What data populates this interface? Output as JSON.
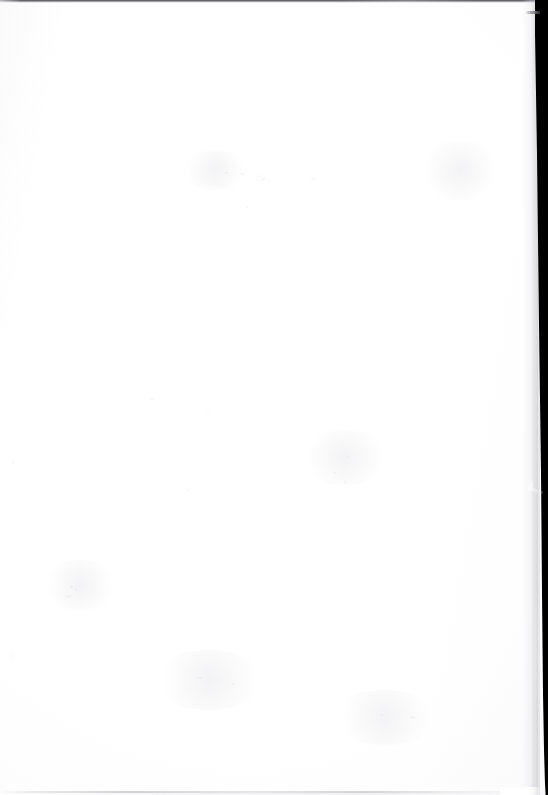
{
  "page": {
    "kind": "scanned-blank-page",
    "text_content": "",
    "width_px": 548,
    "height_px": 795,
    "background_color": "#ffffff",
    "paper_color": "#fdfdfe"
  },
  "edges": {
    "top_line": {
      "name": "top-scan-edge-line",
      "color": "#2e2e32",
      "thickness_px": 3,
      "visible": true
    },
    "bottom_line": {
      "name": "bottom-scan-edge-line",
      "color": "#96969e",
      "thickness_px": 2,
      "visible": true
    },
    "left_edge": {
      "name": "left-page-edge",
      "color": "#fbfbfc",
      "visible": false
    }
  },
  "scanner_band": {
    "name": "right-scanner-background-band",
    "color": "#000000",
    "side": "right",
    "top_width_px": 21,
    "bottom_width_px": 11,
    "slant": "page edge drifts rightward from top to bottom"
  },
  "artifacts": {
    "band_streak": {
      "name": "white-diagonal-streak",
      "color": "#ffffff",
      "approx_x": 528,
      "approx_y": 488
    },
    "corner_tick": {
      "name": "top-right-tick-mark",
      "color": "#6c6c74",
      "approx_x": 525,
      "approx_y": 12
    },
    "dust_specks": {
      "name": "scanner-dust-specks",
      "color": "#d8d8de",
      "count": 22
    }
  },
  "specks": [
    {
      "x": 225,
      "y": 172,
      "cls": "s1"
    },
    {
      "x": 241,
      "y": 173,
      "cls": "s1"
    },
    {
      "x": 258,
      "y": 175,
      "cls": "s2"
    },
    {
      "x": 261,
      "y": 178,
      "cls": "s3"
    },
    {
      "x": 268,
      "y": 180,
      "cls": "s2"
    },
    {
      "x": 246,
      "y": 206,
      "cls": "s2"
    },
    {
      "x": 310,
      "y": 178,
      "cls": "s4"
    },
    {
      "x": 347,
      "y": 456,
      "cls": "s2"
    },
    {
      "x": 333,
      "y": 472,
      "cls": "s1"
    },
    {
      "x": 344,
      "y": 480,
      "cls": "s5"
    },
    {
      "x": 150,
      "y": 397,
      "cls": "s3"
    },
    {
      "x": 207,
      "y": 409,
      "cls": "s2"
    },
    {
      "x": 187,
      "y": 489,
      "cls": "s2"
    },
    {
      "x": 70,
      "y": 586,
      "cls": "s1"
    },
    {
      "x": 75,
      "y": 589,
      "cls": "s2"
    },
    {
      "x": 66,
      "y": 595,
      "cls": "s3"
    },
    {
      "x": 196,
      "y": 677,
      "cls": "s4"
    },
    {
      "x": 232,
      "y": 683,
      "cls": "s2"
    },
    {
      "x": 381,
      "y": 714,
      "cls": "s2"
    },
    {
      "x": 410,
      "y": 716,
      "cls": "s3"
    },
    {
      "x": 12,
      "y": 460,
      "cls": "s5"
    },
    {
      "x": 10,
      "y": 654,
      "cls": "s5"
    }
  ],
  "smudges": [
    {
      "x": 180,
      "y": 150,
      "w": 70,
      "h": 40
    },
    {
      "x": 300,
      "y": 430,
      "w": 90,
      "h": 55
    },
    {
      "x": 40,
      "y": 560,
      "w": 80,
      "h": 50
    },
    {
      "x": 150,
      "y": 650,
      "w": 120,
      "h": 60
    },
    {
      "x": 330,
      "y": 690,
      "w": 110,
      "h": 55
    },
    {
      "x": 420,
      "y": 140,
      "w": 80,
      "h": 60
    }
  ]
}
